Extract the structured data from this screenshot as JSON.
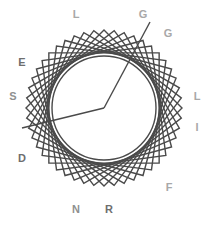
{
  "figure": {
    "background_color": "#ffffff",
    "canvas": {
      "width": 208,
      "height": 226
    },
    "center": {
      "x": 104,
      "y": 108
    },
    "geometry": {
      "type": "rotating-squares-envelope",
      "square_count": 12,
      "square_half_diagonal": 78,
      "rotation_step_degrees": 7.5,
      "base_rotation_degrees": 45,
      "envelope_circle_radius": 52,
      "stroke_color": "#4a4a4a",
      "stroke_width": 1.4,
      "envelope_stroke_width": 1.4
    },
    "extra_rays": [
      {
        "name": "ray-top-right",
        "x1": 104,
        "y1": 108,
        "x2": 150,
        "y2": 22
      },
      {
        "name": "ray-left",
        "x1": 104,
        "y1": 108,
        "x2": 22,
        "y2": 128
      }
    ],
    "letters": [
      {
        "id": "L-top-left",
        "char": "L",
        "x": 76,
        "y": 14,
        "color": "#a8a8a8"
      },
      {
        "id": "G-top",
        "char": "G",
        "x": 143,
        "y": 14,
        "color": "#a8a8a8"
      },
      {
        "id": "G-upper-right",
        "char": "G",
        "x": 168,
        "y": 33,
        "color": "#a8a8a8"
      },
      {
        "id": "L-right",
        "char": "L",
        "x": 197,
        "y": 96,
        "color": "#a8a8a8"
      },
      {
        "id": "I-right",
        "char": "I",
        "x": 197,
        "y": 127,
        "color": "#a8a8a8"
      },
      {
        "id": "F-lower-right",
        "char": "F",
        "x": 169,
        "y": 187,
        "color": "#a8a8a8"
      },
      {
        "id": "R-bottom",
        "char": "R",
        "x": 109,
        "y": 209,
        "color": "#6e6e6e"
      },
      {
        "id": "N-bottom-left",
        "char": "N",
        "x": 76,
        "y": 209,
        "color": "#8f8f8f"
      },
      {
        "id": "D-lower-left",
        "char": "D",
        "x": 22,
        "y": 158,
        "color": "#6e6e6e"
      },
      {
        "id": "S-left",
        "char": "S",
        "x": 13,
        "y": 96,
        "color": "#8f8f8f"
      },
      {
        "id": "E-upper-left",
        "char": "E",
        "x": 22,
        "y": 62,
        "color": "#6e6e6e"
      }
    ],
    "word": "LGGLIFRNDSE"
  }
}
